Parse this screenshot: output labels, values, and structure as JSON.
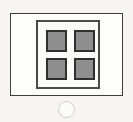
{
  "screen": {
    "width": 133,
    "height": 122,
    "background_color": "#f6f5f3",
    "description": "Line-art icon of a device control panel with a 2x2 grid of square keys and a round button below"
  },
  "device": {
    "name": "device-faceplate",
    "border_color": "#3d3d3d",
    "fill_color": "#fdfdfc",
    "inner_frame": {
      "name": "button-frame",
      "border_color": "#4a4a4a",
      "fill_color": "#fbfbfa"
    },
    "keys": [
      {
        "id": "key-top-left",
        "position": "top-left",
        "fill_color": "#8e8e8e",
        "border_color": "#2f2f2f"
      },
      {
        "id": "key-top-right",
        "position": "top-right",
        "fill_color": "#8e8e8e",
        "border_color": "#2f2f2f"
      },
      {
        "id": "key-bottom-left",
        "position": "bottom-left",
        "fill_color": "#8e8e8e",
        "border_color": "#2f2f2f"
      },
      {
        "id": "key-bottom-right",
        "position": "bottom-right",
        "fill_color": "#8e8e8e",
        "border_color": "#2f2f2f"
      }
    ],
    "round_button": {
      "id": "round-button",
      "border_color": "#cfcfcf",
      "fill_color": "#fbfbfa"
    }
  }
}
